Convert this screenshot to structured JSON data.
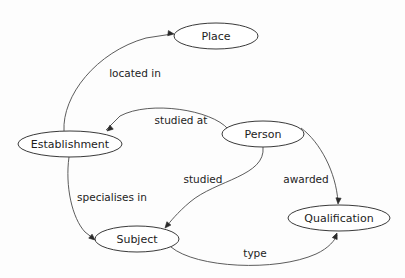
{
  "diagram": {
    "background_color": "#fdfdfd",
    "node_stroke_color": "#3a3a3a",
    "edge_stroke_color": "#4a4a4a",
    "text_color": "#1d1d1d",
    "nodes": [
      {
        "id": "place",
        "label": "Place",
        "cx": 216,
        "cy": 36,
        "rx": 42,
        "ry": 13
      },
      {
        "id": "establishment",
        "label": "Establishment",
        "cx": 70,
        "cy": 144,
        "rx": 52,
        "ry": 13
      },
      {
        "id": "person",
        "label": "Person",
        "cx": 263,
        "cy": 134,
        "rx": 41,
        "ry": 13
      },
      {
        "id": "qualification",
        "label": "Qualification",
        "cx": 339,
        "cy": 218,
        "rx": 51,
        "ry": 13
      },
      {
        "id": "subject",
        "label": "Subject",
        "cx": 137,
        "cy": 239,
        "rx": 42,
        "ry": 13
      }
    ],
    "edges": [
      {
        "id": "located-in",
        "label": "located in",
        "from": "establishment",
        "to": "place",
        "label_x": 135,
        "label_y": 74,
        "path": "M 64,131 C 62,96 96,52 146,38 L 172,34"
      },
      {
        "id": "studied-at",
        "label": "studied at",
        "from": "person",
        "to": "establishment",
        "label_x": 181,
        "label_y": 121,
        "path": "M 228,129 C 212,110 150,100 120,116 L 106,130"
      },
      {
        "id": "specialises-in",
        "label": "specialises in",
        "from": "establishment",
        "to": "subject",
        "label_x": 112,
        "label_y": 198,
        "path": "M 69,157 C 65,186 72,218 85,232 L 94,239"
      },
      {
        "id": "studied",
        "label": "studied",
        "from": "person",
        "to": "subject",
        "label_x": 203,
        "label_y": 180,
        "path": "M 263,147 C 266,176 216,180 190,202 C 177,213 170,222 166,227"
      },
      {
        "id": "awarded",
        "label": "awarded",
        "from": "person",
        "to": "qualification",
        "label_x": 306,
        "label_y": 180,
        "path": "M 301,128 C 320,142 336,172 338,202"
      },
      {
        "id": "type",
        "label": "type",
        "from": "subject",
        "to": "qualification",
        "label_x": 255,
        "label_y": 254,
        "path": "M 171,247 C 196,268 276,272 316,254 C 329,248 335,240 337,235"
      }
    ],
    "arrowheads": [
      {
        "for": "located-in",
        "x": 174,
        "y": 34,
        "angle": 8
      },
      {
        "for": "studied-at",
        "x": 107,
        "y": 131,
        "angle": 140
      },
      {
        "for": "specialises-in",
        "x": 95,
        "y": 240,
        "angle": 40
      },
      {
        "for": "studied",
        "x": 165,
        "y": 228,
        "angle": 130
      },
      {
        "for": "awarded",
        "x": 338,
        "y": 204,
        "angle": 95
      },
      {
        "for": "type",
        "x": 337,
        "y": 233,
        "angle": -68
      }
    ]
  }
}
